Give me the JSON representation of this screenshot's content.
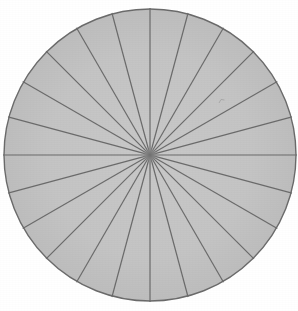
{
  "figure": {
    "kind": "sectored-circle",
    "background_color": "#ffffff"
  },
  "chart_data": {
    "type": "pie",
    "title": "",
    "subtitle": "",
    "xlabel": "",
    "ylabel": "",
    "grid": false,
    "legend": "none",
    "slice_count": 24,
    "slice_angle_degrees": 15,
    "categories": [
      "1",
      "2",
      "3",
      "4",
      "5",
      "6",
      "7",
      "8",
      "9",
      "10",
      "11",
      "12",
      "13",
      "14",
      "15",
      "16",
      "17",
      "18",
      "19",
      "20",
      "21",
      "22",
      "23",
      "24"
    ],
    "values": [
      15,
      15,
      15,
      15,
      15,
      15,
      15,
      15,
      15,
      15,
      15,
      15,
      15,
      15,
      15,
      15,
      15,
      15,
      15,
      15,
      15,
      15,
      15,
      15
    ],
    "value_unit": "degrees",
    "percent_each": 4.1667,
    "spoke_angles_degrees": [
      0,
      15,
      30,
      45,
      60,
      75,
      90,
      105,
      120,
      135,
      150,
      165,
      180,
      195,
      210,
      225,
      240,
      255,
      270,
      285,
      300,
      315,
      330,
      345
    ],
    "slice_fill_color": "#c4c4c4",
    "outline_color": "#6b6b6b",
    "spoke_color": "#6b6b6b",
    "hub_color": "#8a8a8a",
    "start_angle_degrees": 90,
    "direction": "clockwise",
    "annotations": []
  },
  "geometry": {
    "center_x": 150,
    "center_y": 155,
    "radius": 146,
    "outline_width": 1.4,
    "spoke_width": 1.2,
    "hub_radius": 7
  },
  "artifacts": [
    {
      "name": "ink-speck",
      "x": 221,
      "y": 101,
      "size": 5
    }
  ]
}
